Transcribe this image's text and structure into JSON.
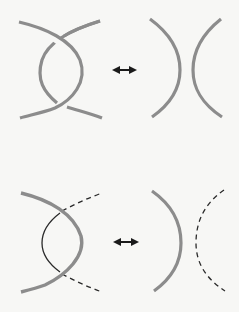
{
  "diagram": {
    "type": "knot-diagram-skein-move",
    "colors": {
      "background": "#f7f7f5",
      "thick_strand": "#8c8c8c",
      "thin_strand": "#2a2a2a",
      "arrow": "#1a1a1a"
    },
    "rows": [
      {
        "name": "top-row",
        "left": {
          "description": "two thick gray strands forming a twisted crossing with two crossings (over at top, over at bottom)",
          "strands": [
            "thick",
            "thick"
          ]
        },
        "arrow": "double-headed-arrow",
        "right": {
          "description": "two thick gray arcs facing away from each other )(",
          "strands": [
            "thick",
            "thick"
          ]
        }
      },
      {
        "name": "bottom-row",
        "left": {
          "description": "thick gray arc with thin solid arc inside and dashed continuation lines",
          "strands": [
            "thick",
            "thin-solid",
            "dashed",
            "dashed"
          ]
        },
        "arrow": "double-headed-arrow",
        "right": {
          "description": "thick gray arc and dashed arc facing away from each other )(",
          "strands": [
            "thick",
            "dashed"
          ]
        }
      }
    ]
  }
}
